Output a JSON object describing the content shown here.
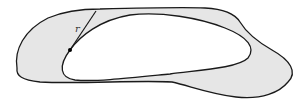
{
  "figure": {
    "label_r": "r",
    "colors": {
      "stroke": "#1a1a1a",
      "annulus_fill": "#e6e6e6",
      "hole_fill": "#ffffff",
      "point": "#000000"
    }
  }
}
